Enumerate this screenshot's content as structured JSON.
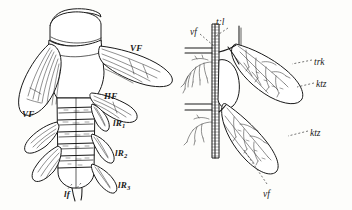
{
  "plate": {
    "width": 352,
    "height": 210,
    "background_color": "#fdfdfb",
    "ink_color": "#1a1a1a",
    "description": "Two-part line engraving: left, dorsal view of an insect abdomen with fore and hind wings; right, detail of tracheal trunk with branching wing tracheae."
  },
  "figures": [
    {
      "id": "left-figure",
      "name": "insect-dorsal-view",
      "labels": [
        {
          "id": "vf-right",
          "text": "VF",
          "style": "bold",
          "x": 130,
          "y": 44,
          "leader": false
        },
        {
          "id": "vf-left",
          "text": "VF",
          "style": "bold",
          "x": 22,
          "y": 110,
          "leader": false
        },
        {
          "id": "hf",
          "text": "HF",
          "style": "bold",
          "x": 104,
          "y": 92,
          "leader": false
        },
        {
          "id": "lr1",
          "text": "lR",
          "sub": "1",
          "style": "bold",
          "x": 113,
          "y": 119,
          "leader": false
        },
        {
          "id": "lr2",
          "text": "lR",
          "sub": "2",
          "style": "bold",
          "x": 115,
          "y": 149,
          "leader": false
        },
        {
          "id": "lr3",
          "text": "lR",
          "sub": "3",
          "style": "bold",
          "x": 118,
          "y": 181,
          "leader": false
        },
        {
          "id": "lf",
          "text": "lf",
          "style": "bold",
          "x": 64,
          "y": 190,
          "leader": true
        }
      ]
    },
    {
      "id": "right-figure",
      "name": "tracheal-detail-view",
      "labels": [
        {
          "id": "vf-top",
          "text": "vf",
          "style": "italic",
          "x": 190,
          "y": 28,
          "leader": true
        },
        {
          "id": "trl",
          "text": "t:l",
          "style": "italic",
          "x": 216,
          "y": 18,
          "leader": true
        },
        {
          "id": "trk",
          "text": "trk",
          "style": "italic",
          "x": 314,
          "y": 58,
          "leader": true
        },
        {
          "id": "ktz-upper",
          "text": "ktz",
          "style": "italic",
          "x": 316,
          "y": 80,
          "leader": true
        },
        {
          "id": "ktz-lower",
          "text": "ktz",
          "style": "italic",
          "x": 310,
          "y": 129,
          "leader": true
        },
        {
          "id": "vf-bottom",
          "text": "vf",
          "style": "italic",
          "x": 263,
          "y": 190,
          "leader": true
        }
      ]
    }
  ]
}
